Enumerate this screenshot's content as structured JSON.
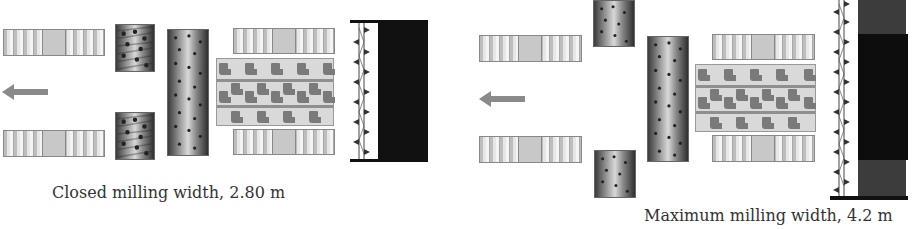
{
  "diagrams": [
    {
      "id": "closed",
      "caption": "Closed milling width, 2.80 m",
      "direction": "left"
    },
    {
      "id": "maximum",
      "caption": "Maximum milling width, 4.2 m",
      "direction": "left"
    }
  ],
  "colors": {
    "track": "#d0d0d0",
    "drum_dark": "#2e2e2e",
    "frame": "#d9d9d9",
    "moldboard_black": "#111111",
    "arrow": "#8a8a8a"
  }
}
